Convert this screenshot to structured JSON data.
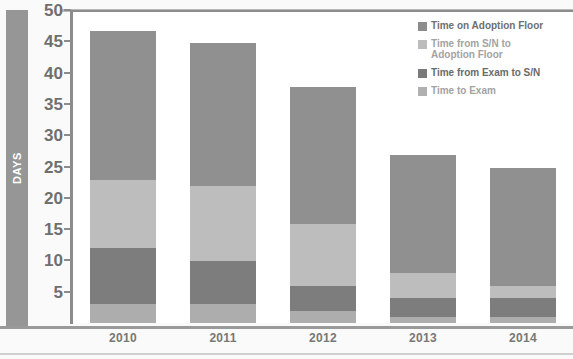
{
  "axis": {
    "y_title": "DAYS",
    "y_ticks": [
      "50",
      "45",
      "40",
      "35",
      "30",
      "25",
      "20",
      "15",
      "10",
      "5"
    ],
    "x_labels": [
      "2010",
      "2011",
      "2012",
      "2013",
      "2014"
    ]
  },
  "legend": {
    "items": [
      {
        "label": "Time on Adoption Floor",
        "color": "#8c8c8c",
        "text_color": "#6f6f6f"
      },
      {
        "label": "Time from S/N to\nAdoption Floor",
        "color": "#bcbcbc",
        "text_color": "#a3a3a3"
      },
      {
        "label": "Time from Exam to S/N",
        "color": "#7a7a7a",
        "text_color": "#6a6a6a"
      },
      {
        "label": "Time to Exam",
        "color": "#b0b0b0",
        "text_color": "#a3a3a3"
      }
    ]
  },
  "colors": {
    "time_to_exam": "#adadad",
    "exam_to_sn": "#7d7d7d",
    "sn_to_floor": "#bdbdbd",
    "adoption_floor": "#909090",
    "axis": "#8c8c8c",
    "tick_text": "#6f6f6f",
    "xlabel_text": "#777777",
    "days_bar": "#969696"
  },
  "chart_data": {
    "type": "bar",
    "title": "",
    "xlabel": "",
    "ylabel": "DAYS",
    "ylim": [
      0,
      50
    ],
    "ytick_step": 5,
    "grid": false,
    "stacked": true,
    "legend_position": "top-right",
    "categories": [
      "2010",
      "2011",
      "2012",
      "2013",
      "2014"
    ],
    "series": [
      {
        "name": "Time to Exam",
        "color": "#adadad",
        "values": [
          3,
          3,
          2,
          1,
          1
        ]
      },
      {
        "name": "Time from Exam to S/N",
        "color": "#7d7d7d",
        "values": [
          9,
          7,
          4,
          3,
          3
        ]
      },
      {
        "name": "Time from S/N to Adoption Floor",
        "color": "#bdbdbd",
        "values": [
          11,
          12,
          10,
          4,
          2
        ]
      },
      {
        "name": "Time on Adoption Floor",
        "color": "#909090",
        "values": [
          24,
          23,
          22,
          19,
          19
        ]
      }
    ],
    "totals": [
      47,
      45,
      38,
      27,
      25
    ]
  }
}
